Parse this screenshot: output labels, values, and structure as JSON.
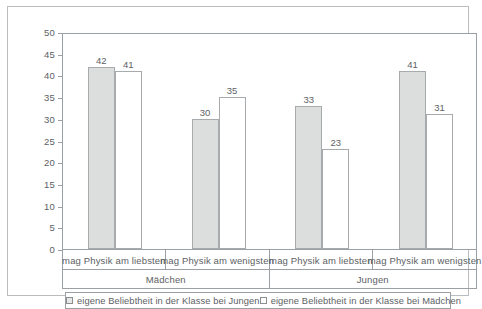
{
  "chart_data": {
    "type": "bar",
    "title": "",
    "subtitle": "",
    "xlabel": "",
    "ylabel": "",
    "ylim": [
      0,
      50
    ],
    "yticks": [
      0,
      5,
      10,
      15,
      20,
      25,
      30,
      35,
      40,
      45,
      50
    ],
    "grid": false,
    "legend_position": "bottom",
    "categories": [
      "mag Physik am liebsten",
      "mag Physik am wenigsten",
      "mag Physik am liebsten",
      "mag Physik am wenigsten"
    ],
    "groups": [
      {
        "label": "Mädchen",
        "categories": [
          0,
          1
        ]
      },
      {
        "label": "Jungen",
        "categories": [
          2,
          3
        ]
      }
    ],
    "series": [
      {
        "name": "eigene Beliebtheit in der Klasse bei Jungen",
        "values": [
          42,
          30,
          33,
          41
        ],
        "fill": "#dcdddd",
        "stroke": "#a7abae"
      },
      {
        "name": "eigene Beliebtheit in der Klasse bei Mädchen",
        "values": [
          41,
          35,
          23,
          31
        ],
        "fill": "#ffffff",
        "stroke": "#a7abae"
      }
    ],
    "data_labels": [
      42,
      41,
      30,
      35,
      33,
      23,
      41,
      31
    ]
  },
  "legend": {
    "items": [
      {
        "label": "eigene Beliebtheit in der Klasse bei Jungen"
      },
      {
        "label": "eigene Beliebtheit in der Klasse bei Mädchen"
      }
    ]
  },
  "axis": {
    "y_tick_labels": [
      "50",
      "45",
      "40",
      "35",
      "30",
      "25",
      "20",
      "15",
      "10",
      "5",
      "0"
    ]
  },
  "colors": {
    "frame": "#b9bdc0",
    "axis": "#9aa0a4",
    "text": "#5d6164",
    "bar_filled": "#dcdddd",
    "bar_hollow": "#ffffff",
    "bar_stroke": "#a7abae",
    "background": "#ffffff"
  }
}
